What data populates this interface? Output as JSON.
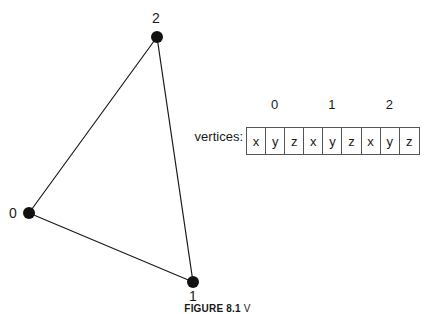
{
  "figure": {
    "background_color": "#ffffff",
    "ink_color": "#1a1a1a",
    "border_color": "#555555"
  },
  "diagram": {
    "name": "triangle-vertex-diagram",
    "vertices": [
      {
        "label": "0",
        "cx": 29,
        "cy": 213,
        "label_x": 9,
        "label_y": 206
      },
      {
        "label": "1",
        "cx": 193,
        "cy": 282,
        "label_x": 189,
        "label_y": 289
      },
      {
        "label": "2",
        "cx": 157,
        "cy": 37,
        "label_x": 152,
        "label_y": 11
      }
    ],
    "edges": [
      {
        "from": "0",
        "to": "2"
      },
      {
        "from": "2",
        "to": "1"
      },
      {
        "from": "0",
        "to": "1"
      }
    ],
    "dot_radius": 6,
    "edge_width": 1.2
  },
  "array": {
    "caption": "vertices:",
    "index_labels": [
      "0",
      "1",
      "2"
    ],
    "cells": [
      "x",
      "y",
      "z",
      "x",
      "y",
      "z",
      "x",
      "y",
      "z"
    ]
  },
  "caption": {
    "label": "FIGURE 8.1",
    "text": "V"
  }
}
